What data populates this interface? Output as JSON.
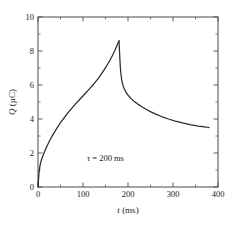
{
  "chart_data": {
    "type": "line",
    "title": "",
    "xlabel": "t (ms)",
    "xlabel_symbol": "t",
    "xlabel_unit": "(ms)",
    "ylabel": "Q (µC)",
    "ylabel_symbol": "Q",
    "ylabel_unit": "(µC)",
    "xlim": [
      0,
      400
    ],
    "ylim": [
      0,
      10
    ],
    "grid": false,
    "legend": "none",
    "xticks": [
      0,
      100,
      200,
      300,
      400
    ],
    "xtick_labels": [
      "0",
      "100",
      "200",
      "300",
      "400"
    ],
    "xticks_minor": [
      50,
      150,
      250,
      350
    ],
    "yticks": [
      0,
      2,
      4,
      6,
      8,
      10
    ],
    "ytick_labels": [
      "0",
      "2",
      "4",
      "6",
      "8",
      "10"
    ],
    "yticks_minor": [
      1,
      3,
      5,
      7,
      9
    ],
    "annotations": [
      {
        "text": "τ = 200 ms",
        "symbol": "τ",
        "rest": " = 200 ms",
        "x": 150,
        "y": 1.55
      }
    ],
    "peak": {
      "x": 180,
      "y": 8.6
    },
    "end_point": {
      "x": 380,
      "y": 3.5
    },
    "series": [
      {
        "name": "charge",
        "phase": "charging",
        "points": [
          [
            0,
            0.0
          ],
          [
            2,
            0.75
          ],
          [
            4,
            1.2
          ],
          [
            6,
            1.45
          ],
          [
            8,
            1.62
          ],
          [
            10,
            1.78
          ],
          [
            14,
            2.05
          ],
          [
            18,
            2.3
          ],
          [
            22,
            2.52
          ],
          [
            26,
            2.73
          ],
          [
            30,
            2.93
          ],
          [
            36,
            3.2
          ],
          [
            42,
            3.46
          ],
          [
            50,
            3.78
          ],
          [
            58,
            4.07
          ],
          [
            66,
            4.34
          ],
          [
            74,
            4.6
          ],
          [
            84,
            4.9
          ],
          [
            94,
            5.19
          ],
          [
            104,
            5.47
          ],
          [
            114,
            5.76
          ],
          [
            124,
            6.06
          ],
          [
            134,
            6.39
          ],
          [
            144,
            6.77
          ],
          [
            152,
            7.1
          ],
          [
            160,
            7.46
          ],
          [
            166,
            7.77
          ],
          [
            171,
            8.05
          ],
          [
            175,
            8.3
          ],
          [
            178,
            8.48
          ],
          [
            180,
            8.6
          ]
        ]
      },
      {
        "name": "discharge",
        "phase": "discharging",
        "points": [
          [
            180,
            8.6
          ],
          [
            181,
            8.05
          ],
          [
            182,
            7.5
          ],
          [
            183,
            7.05
          ],
          [
            184,
            6.72
          ],
          [
            186,
            6.3
          ],
          [
            188,
            6.05
          ],
          [
            191,
            5.82
          ],
          [
            195,
            5.6
          ],
          [
            200,
            5.4
          ],
          [
            206,
            5.22
          ],
          [
            213,
            5.05
          ],
          [
            221,
            4.89
          ],
          [
            230,
            4.73
          ],
          [
            240,
            4.57
          ],
          [
            251,
            4.42
          ],
          [
            263,
            4.27
          ],
          [
            276,
            4.13
          ],
          [
            290,
            4.0
          ],
          [
            305,
            3.88
          ],
          [
            321,
            3.77
          ],
          [
            338,
            3.67
          ],
          [
            356,
            3.58
          ],
          [
            370,
            3.53
          ],
          [
            380,
            3.5
          ]
        ]
      }
    ]
  },
  "figure": {
    "background": "#ffffff",
    "curve_color": "#2b2b2b",
    "axis_color": "#4a4a4a"
  }
}
